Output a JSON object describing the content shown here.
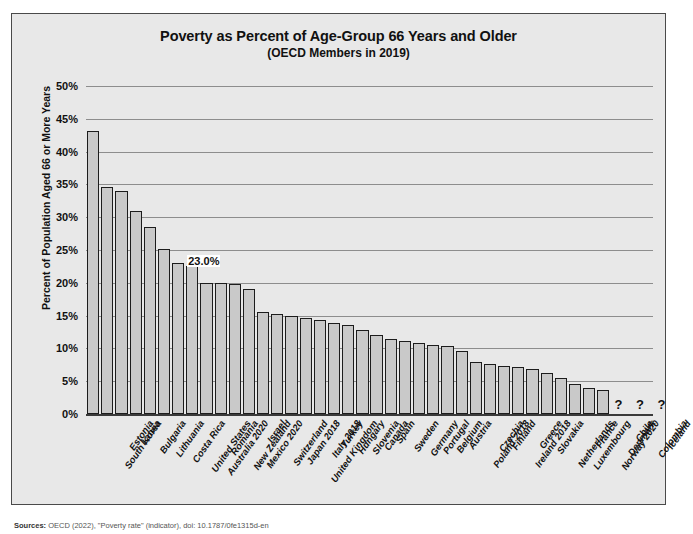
{
  "chart_data": {
    "type": "bar",
    "title": "Poverty as Percent of Age-Group 66 Years and Older",
    "subtitle": "(OECD Members in 2019)",
    "xlabel": "",
    "ylabel": "Percent of Population Aged 66 or More Years",
    "ylim": [
      0,
      50
    ],
    "ytick_labels": [
      "0%",
      "5%",
      "10%",
      "15%",
      "20%",
      "25%",
      "30%",
      "35%",
      "40%",
      "45%",
      "50%"
    ],
    "ytick_values": [
      0,
      5,
      10,
      15,
      20,
      25,
      30,
      35,
      40,
      45,
      50
    ],
    "grid": true,
    "legend": "none",
    "bar_fill_color": "#c9c9c9",
    "bar_edge_color": "#1c1c1c",
    "plot_background_color": "#e8e8e8",
    "categories": [
      "South Korea",
      "Estonia",
      "Latvia",
      "Bulgaria",
      "Lithuania",
      "Costa Rica",
      "United States",
      "Australia 2020",
      "Romania",
      "New Zealand",
      "Mexico 2020",
      "Israel",
      "Switzerland",
      "Japan 2018",
      "United Kingdom",
      "Italy 2018",
      "Turkey",
      "Hungary",
      "Slovenia",
      "Canada",
      "Spain",
      "Sweden",
      "Germany",
      "Portugal",
      "Belgium",
      "Austria",
      "Poland 2018",
      "Czechia",
      "Finland",
      "Ireland 2018",
      "Greece",
      "Slovakia",
      "Netherlands",
      "Luxembourg",
      "France",
      "Norway 2020",
      "Denmark",
      "Chile",
      "Colombia",
      "Iceland"
    ],
    "values": [
      43.2,
      34.6,
      34.0,
      31.0,
      28.5,
      25.1,
      23.0,
      22.6,
      20.0,
      20.0,
      19.8,
      19.0,
      15.6,
      15.2,
      14.9,
      14.7,
      14.4,
      13.8,
      13.5,
      12.8,
      12.1,
      11.5,
      11.1,
      10.9,
      10.5,
      10.3,
      9.6,
      8.0,
      7.6,
      7.3,
      7.1,
      6.8,
      6.2,
      5.5,
      4.5,
      4.0,
      3.6,
      null,
      null,
      null
    ],
    "missing_categories": [
      "Chile",
      "Colombia",
      "Iceland"
    ],
    "missing_marker": "? ? ?",
    "annotations": [
      {
        "label": "23.0%",
        "category": "United States",
        "value": 23.0
      }
    ]
  },
  "source": {
    "prefix": "Sources:",
    "text": "OECD (2022), \"Poverty rate\" (indicator), doi: 10.1787/0fe1315d-en"
  }
}
